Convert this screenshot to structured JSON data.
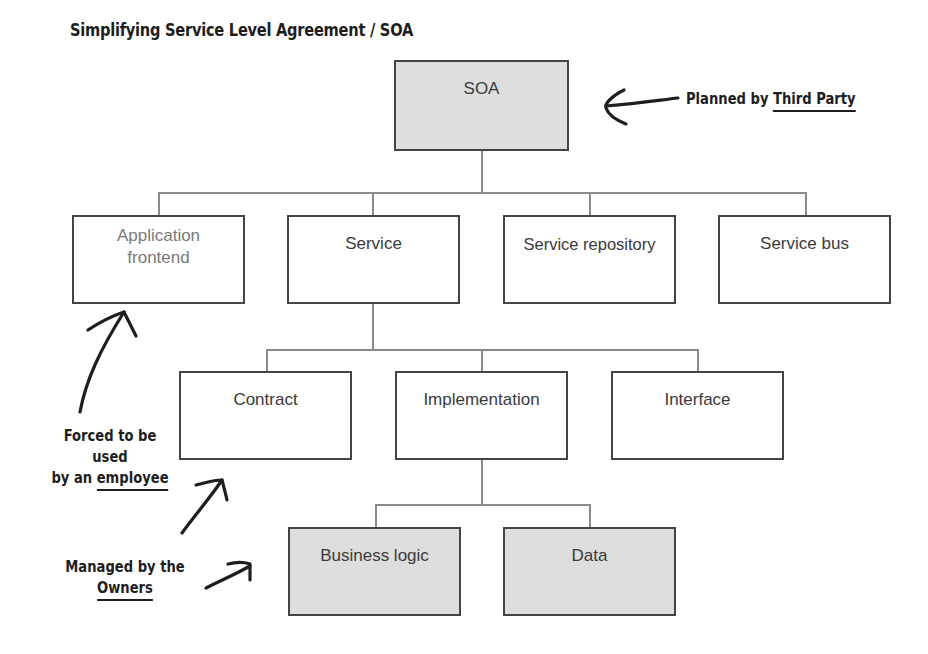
{
  "title": "Simplifying Service Level Agreement / SOA",
  "nodes": {
    "root": {
      "label": "SOA"
    },
    "level1": [
      {
        "label_line1": "Application",
        "label_line2": "frontend"
      },
      {
        "label": "Service"
      },
      {
        "label": "Service repository"
      },
      {
        "label": "Service bus"
      }
    ],
    "level2": [
      {
        "label": "Contract"
      },
      {
        "label": "Implementation"
      },
      {
        "label": "Interface"
      }
    ],
    "level3": [
      {
        "label": "Business logic"
      },
      {
        "label": "Data"
      }
    ]
  },
  "annotations": {
    "third_party": {
      "prefix": "Planned by ",
      "underlined": "Third Party"
    },
    "employee": {
      "line1": "Forced to be",
      "line2": "used",
      "line3_prefix": "by an ",
      "line3_underlined": "employee"
    },
    "owners": {
      "line1": "Managed by the",
      "line2_underlined": "Owners"
    }
  },
  "colors": {
    "shaded_fill": "#dedede",
    "border": "#444444",
    "connector": "#8a8a8a",
    "handwriting": "#1e1e1e"
  }
}
